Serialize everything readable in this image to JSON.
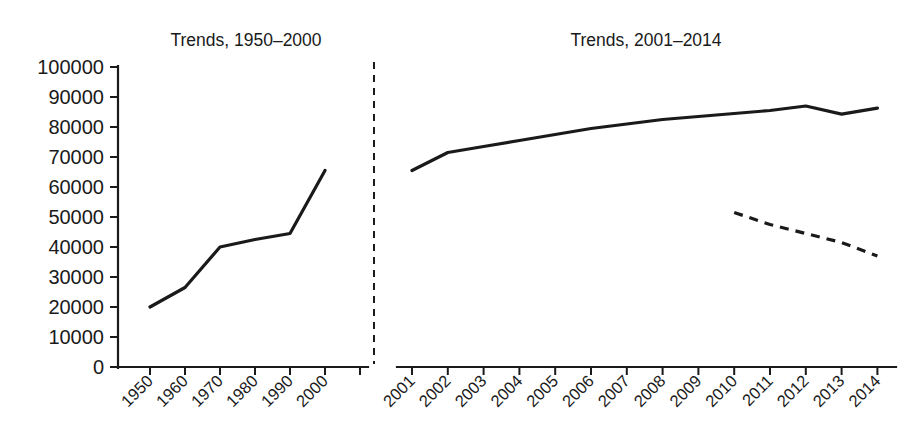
{
  "chart_data": {
    "type": "line",
    "title": "",
    "panels": [
      {
        "id": "left-panel",
        "title": "Trends, 1950–2000",
        "xlabel": "",
        "ylabel": "",
        "categories": [
          "1950",
          "1960",
          "1970",
          "1980",
          "1990",
          "2000"
        ],
        "xtick_labels": [
          "1950",
          "1960",
          "1970",
          "1980",
          "1990",
          "2000"
        ],
        "series": [
          {
            "name": "solid-series",
            "style": "solid",
            "x": [
              "1950",
              "1960",
              "1970",
              "1980",
              "1990",
              "2000"
            ],
            "values": [
              20000,
              26500,
              40000,
              42500,
              44500,
              65500
            ]
          }
        ]
      },
      {
        "id": "right-panel",
        "title": "Trends, 2001–2014",
        "xlabel": "",
        "ylabel": "",
        "categories": [
          "2001",
          "2002",
          "2003",
          "2004",
          "2005",
          "2006",
          "2007",
          "2008",
          "2009",
          "2010",
          "2011",
          "2012",
          "2013",
          "2014"
        ],
        "xtick_labels": [
          "2001",
          "2002",
          "2003",
          "2004",
          "2005",
          "2006",
          "2007",
          "2008",
          "2009",
          "2010",
          "2011",
          "2012",
          "2013",
          "2014"
        ],
        "series": [
          {
            "name": "solid-series",
            "style": "solid",
            "x": [
              "2001",
              "2002",
              "2003",
              "2004",
              "2005",
              "2006",
              "2007",
              "2008",
              "2009",
              "2010",
              "2011",
              "2012",
              "2013",
              "2014"
            ],
            "values": [
              65500,
              71500,
              73500,
              75500,
              77500,
              79500,
              81000,
              82500,
              83500,
              84500,
              85500,
              87000,
              84300,
              86300
            ]
          },
          {
            "name": "dashed-series",
            "style": "dashed",
            "x": [
              "2010",
              "2011",
              "2012",
              "2013",
              "2014"
            ],
            "values": [
              51500,
              47500,
              44500,
              41500,
              37000
            ]
          }
        ]
      }
    ],
    "ylim": [
      0,
      100000
    ],
    "ytick_values": [
      0,
      10000,
      20000,
      30000,
      40000,
      50000,
      60000,
      70000,
      80000,
      90000,
      100000
    ],
    "ytick_labels": [
      "0",
      "10000",
      "20000",
      "30000",
      "40000",
      "50000",
      "60000",
      "70000",
      "80000",
      "90000",
      "100000"
    ],
    "grid": false,
    "legend": "none",
    "divider": {
      "name": "panel-divider",
      "style": "dashed-vertical"
    },
    "colors": {
      "ink": "#1a1a1a",
      "background": "#ffffff"
    }
  }
}
